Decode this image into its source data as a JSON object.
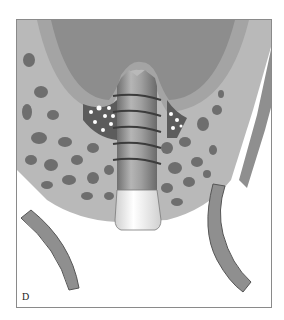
{
  "figure": {
    "panel_label": "D",
    "colors": {
      "bone_background": "#b9b9b9",
      "marrow_spots": "#6e6e6e",
      "tooth_root_dark": "#8d8d8d",
      "tooth_root_light": "#a4a4a4",
      "graft_pocket": "#5c5c5c",
      "graft_particles": "#ffffff",
      "implant_body": "#9a9a9a",
      "implant_collar": "#f2f2f2",
      "cortical_wall": "#8f8f8f",
      "frame_border": "#8a8a8a"
    }
  }
}
